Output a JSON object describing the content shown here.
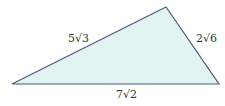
{
  "diagram": {
    "type": "triangle",
    "fill_color": "#e3f3f1",
    "stroke_color": "#4b5b82",
    "vertices": {
      "left": [
        12,
        84
      ],
      "top": [
        166,
        7
      ],
      "right": [
        219,
        84
      ]
    },
    "sides": {
      "left_top": {
        "label": "5√3"
      },
      "top_right": {
        "label": "2√6"
      },
      "bottom": {
        "label": "7√2"
      }
    }
  }
}
